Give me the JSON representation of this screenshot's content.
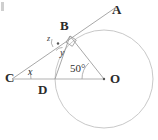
{
  "figure": {
    "background_color": "#ffffff",
    "stroke_color": "#9a9a9a",
    "circle_color": "#bdbdbd",
    "label_color": "#2b2b2b"
  },
  "points": [
    {
      "id": "A",
      "label": "A",
      "x": 113,
      "y": 10,
      "label_x": 112,
      "label_y": 3
    },
    {
      "id": "B",
      "label": "B",
      "x": 70,
      "y": 36,
      "label_x": 60,
      "label_y": 19
    },
    {
      "id": "C",
      "label": "C",
      "x": 12,
      "y": 79,
      "label_x": 5,
      "label_y": 71
    },
    {
      "id": "D",
      "label": "D",
      "x": 55,
      "y": 79,
      "label_x": 38,
      "label_y": 83
    },
    {
      "id": "O",
      "label": "O",
      "x": 104,
      "y": 79,
      "label_x": 110,
      "label_y": 72
    }
  ],
  "angles": [
    {
      "id": "x",
      "label": "x",
      "vertex": "C",
      "label_x": 28,
      "label_y": 67
    },
    {
      "id": "y",
      "label": "y",
      "vertex": "E",
      "label_x": 60,
      "label_y": 48
    },
    {
      "id": "z",
      "label": "z",
      "vertex": "E",
      "label_x": 47,
      "label_y": 35
    },
    {
      "id": "angle50",
      "label": "50°",
      "vertex": "O",
      "label_x": 70,
      "label_y": 63
    }
  ],
  "markers": {
    "right_angle_at_B": "right-angle-square",
    "center_dot_at_O": true,
    "intersection_dot": true
  },
  "circle": {
    "center_x": 104,
    "center_y": 79,
    "radius": 49
  },
  "segments": [
    {
      "id": "CA",
      "from": "C",
      "to": "A",
      "note": "line through C, B to A"
    },
    {
      "id": "CO",
      "from": "C",
      "to": "O",
      "note": "line through C, D to O"
    },
    {
      "id": "OB",
      "from": "O",
      "to": "B",
      "note": "radius to tangent point"
    },
    {
      "id": "DB",
      "from": "D",
      "to": "B",
      "note": "chord from D to B"
    }
  ]
}
